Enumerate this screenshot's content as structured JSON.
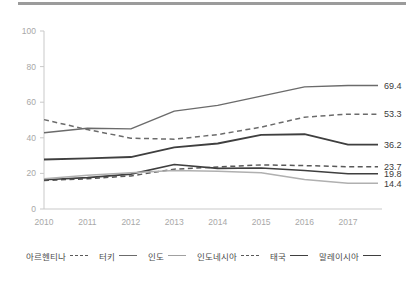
{
  "chart_data": {
    "type": "line",
    "title": "",
    "subtitle": "",
    "xlabel": "",
    "ylabel": "",
    "x": [
      2010,
      2011,
      2012,
      2013,
      2014,
      2015,
      2016,
      2017
    ],
    "xtick_labels": [
      "2010",
      "2011",
      "2012",
      "2013",
      "2014",
      "2015",
      "2016",
      "2017"
    ],
    "ytick_labels": [
      "0",
      "20",
      "40",
      "60",
      "80",
      "100"
    ],
    "yticks": [
      0,
      20,
      40,
      60,
      80,
      100
    ],
    "ylim": [
      0,
      100
    ],
    "xlim": [
      2010,
      2017
    ],
    "grid": false,
    "legend_position": "bottom",
    "series": [
      {
        "name": "아르헨티나",
        "style": "dashed",
        "color": "#595959",
        "width": 1.5,
        "values": [
          16.0,
          17.0,
          18.6,
          22.4,
          23.6,
          24.8,
          24.4,
          23.7
        ],
        "end_label": "23.7"
      },
      {
        "name": "터키",
        "style": "solid",
        "color": "#6b6b6b",
        "width": 1.4,
        "values": [
          42.8,
          45.4,
          45.0,
          55.0,
          58.2,
          63.4,
          68.6,
          69.4
        ],
        "end_label": "69.4"
      },
      {
        "name": "인도",
        "style": "dashed",
        "color": "#6b6b6b",
        "width": 1.5,
        "values": [
          50.2,
          44.6,
          39.8,
          39.2,
          41.8,
          46.0,
          51.6,
          53.3
        ],
        "end_label": "53.3"
      },
      {
        "name": "인도네시아",
        "style": "solid",
        "color": "#3f3f3f",
        "width": 1.8,
        "values": [
          27.8,
          28.4,
          29.2,
          34.6,
          36.8,
          41.6,
          42.0,
          36.2
        ],
        "end_label": "36.2"
      },
      {
        "name": "태국",
        "style": "solid",
        "color": "#3f3f3f",
        "width": 1.6,
        "values": [
          16.4,
          17.6,
          19.6,
          25.0,
          22.8,
          23.0,
          21.6,
          19.8
        ],
        "end_label": "19.8"
      },
      {
        "name": "말레이시아",
        "style": "solid",
        "color": "#b0b0b0",
        "width": 1.5,
        "values": [
          17.0,
          19.0,
          20.4,
          21.6,
          21.2,
          20.4,
          16.6,
          14.4
        ],
        "end_label": "14.4"
      }
    ]
  },
  "legend": {
    "items": [
      {
        "label": "아르헨티나",
        "style": "dashed",
        "color": "#595959"
      },
      {
        "label": "터키",
        "style": "solid",
        "color": "#6b6b6b"
      },
      {
        "label": "인도",
        "style": "solid",
        "color": "#a0a0a0"
      },
      {
        "label": "인도네시아",
        "style": "dashed",
        "color": "#595959"
      },
      {
        "label": "태국",
        "style": "solid",
        "color": "#3f3f3f"
      },
      {
        "label": "말레이시아",
        "style": "solid",
        "color": "#3f3f3f"
      }
    ]
  }
}
